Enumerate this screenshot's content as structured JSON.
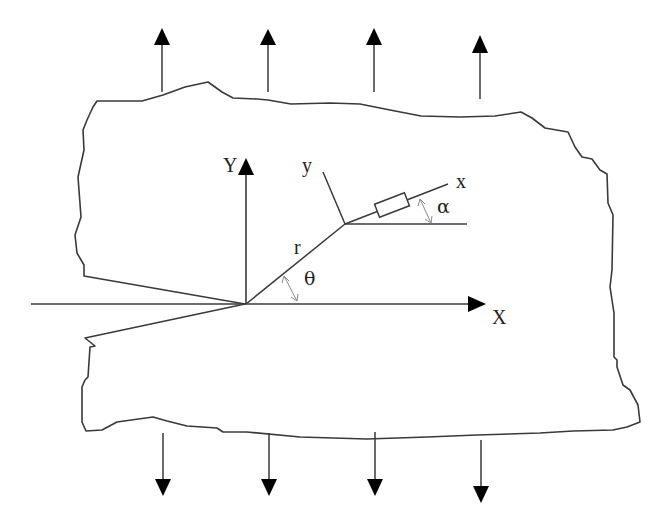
{
  "figure": {
    "labels": {
      "global_y_axis": "Y",
      "global_x_axis": "X",
      "local_y_axis": "y",
      "local_x_axis": "x",
      "radius": "r",
      "theta": "θ",
      "alpha": "α"
    },
    "load_arrows": {
      "top_count": 4,
      "bottom_count": 4,
      "top_direction": "up",
      "bottom_direction": "down"
    },
    "strain_gauge": {
      "present": true,
      "orientation_label": "α"
    },
    "colors": {
      "line": "#3a3a3a",
      "arrowhead": "#000000",
      "angle_marker": "#8a8a8a",
      "background": "#ffffff"
    }
  }
}
